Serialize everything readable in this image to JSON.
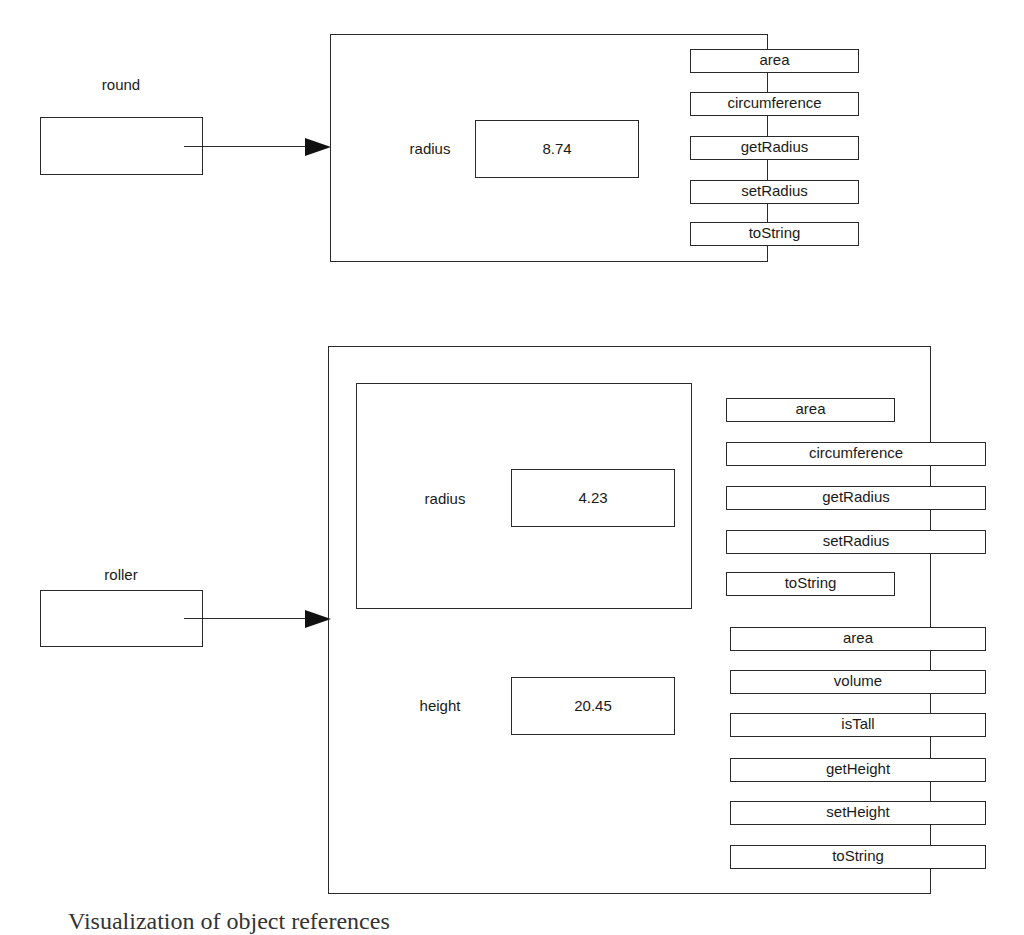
{
  "diagram": {
    "objects": [
      {
        "variable": "round",
        "fields": [
          {
            "name": "radius",
            "value": "8.74"
          }
        ],
        "methods": [
          "area",
          "circumference",
          "getRadius",
          "setRadius",
          "toString"
        ]
      },
      {
        "variable": "roller",
        "inner": {
          "fields": [
            {
              "name": "radius",
              "value": "4.23"
            }
          ],
          "methods": [
            "area",
            "circumference",
            "getRadius",
            "setRadius",
            "toString"
          ]
        },
        "fields": [
          {
            "name": "height",
            "value": "20.45"
          }
        ],
        "methods": [
          "area",
          "volume",
          "isTall",
          "getHeight",
          "setHeight",
          "toString"
        ]
      }
    ],
    "caption": "Visualization of object references"
  }
}
